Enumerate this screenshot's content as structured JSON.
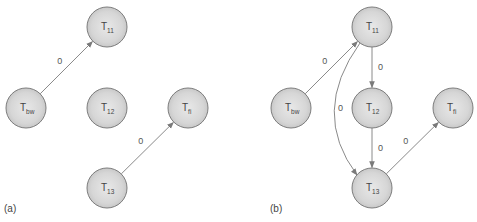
{
  "diagram": {
    "type": "precedence-graph",
    "node_radius": 20,
    "colors": {
      "node_fill_center": "#e6e6e6",
      "node_fill_edge": "#c4c4c4",
      "node_stroke": "#7d7d7d",
      "edge": "#8a8a8a",
      "text": "#444444"
    },
    "panels": [
      {
        "id": "a",
        "label": "(a)",
        "label_pos": [
          4,
          212
        ],
        "nodes": [
          {
            "id": "T11",
            "main": "T",
            "sub": "11",
            "x": 107,
            "y": 27
          },
          {
            "id": "Tbw",
            "main": "T",
            "sub": "bw",
            "x": 26,
            "y": 108
          },
          {
            "id": "T12",
            "main": "T",
            "sub": "12",
            "x": 107,
            "y": 108
          },
          {
            "id": "Tfi",
            "main": "T",
            "sub": "fi",
            "x": 188,
            "y": 108
          },
          {
            "id": "T13",
            "main": "T",
            "sub": "13",
            "x": 107,
            "y": 188
          }
        ],
        "edges": [
          {
            "from": "Tbw",
            "to": "T11",
            "label": "0"
          },
          {
            "from": "T13",
            "to": "Tfi",
            "label": "0"
          }
        ]
      },
      {
        "id": "b",
        "label": "(b)",
        "label_pos": [
          270,
          212
        ],
        "nodes": [
          {
            "id": "T11",
            "main": "T",
            "sub": "11",
            "x": 372,
            "y": 27
          },
          {
            "id": "Tbw",
            "main": "T",
            "sub": "bw",
            "x": 291,
            "y": 108
          },
          {
            "id": "T12",
            "main": "T",
            "sub": "12",
            "x": 372,
            "y": 108
          },
          {
            "id": "Tfi",
            "main": "T",
            "sub": "fi",
            "x": 453,
            "y": 108
          },
          {
            "id": "T13",
            "main": "T",
            "sub": "13",
            "x": 372,
            "y": 188
          }
        ],
        "edges": [
          {
            "from": "Tbw",
            "to": "T11",
            "label": "0"
          },
          {
            "from": "T11",
            "to": "T12",
            "label": "0"
          },
          {
            "from": "T12",
            "to": "T13",
            "label": "0"
          },
          {
            "from": "T11",
            "to": "T13",
            "label": "0",
            "curved": true
          },
          {
            "from": "T13",
            "to": "Tfi",
            "label": "0"
          }
        ]
      }
    ]
  }
}
